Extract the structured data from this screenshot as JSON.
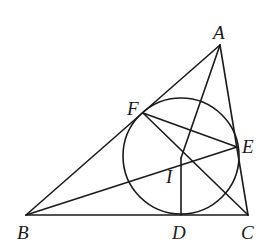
{
  "diagram": {
    "type": "geometry",
    "points": {
      "A": {
        "label": "A",
        "x": 220,
        "y": 45
      },
      "B": {
        "label": "B",
        "x": 26,
        "y": 215
      },
      "C": {
        "label": "C",
        "x": 248,
        "y": 215
      },
      "D": {
        "label": "D",
        "x": 181,
        "y": 215
      },
      "E": {
        "label": "E",
        "x": 237,
        "y": 147
      },
      "F": {
        "label": "F",
        "x": 143,
        "y": 113
      },
      "I": {
        "label": "I",
        "x": 181,
        "y": 158
      }
    },
    "incircle": {
      "center": "I",
      "cx": 181,
      "cy": 156,
      "r": 58
    },
    "segments": [
      "AB",
      "BC",
      "CA",
      "AI",
      "BE",
      "CF",
      "ID",
      "FE"
    ],
    "labels": {
      "A": "A",
      "B": "B",
      "C": "C",
      "D": "D",
      "E": "E",
      "F": "F",
      "I": "I"
    }
  }
}
